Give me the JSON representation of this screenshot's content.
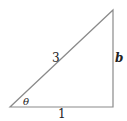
{
  "diagram": {
    "type": "right-triangle",
    "labels": {
      "hypotenuse": "3",
      "adjacent": "1",
      "opposite": "b",
      "angle": "θ"
    },
    "colors": {
      "stroke": "#8a8a8a",
      "text": "#222222",
      "background": "#ffffff"
    }
  }
}
